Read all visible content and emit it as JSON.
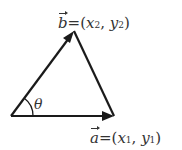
{
  "diagram": {
    "vector_b": {
      "name": "b",
      "eq": "=(",
      "x": "x",
      "xs": "2",
      "comma": ", ",
      "y": "y",
      "ys": "2",
      "close": ")"
    },
    "vector_a": {
      "name": "a",
      "eq": "=(",
      "x": "x",
      "xs": "1",
      "comma": ", ",
      "y": "y",
      "ys": "1",
      "close": ")"
    },
    "angle": "θ",
    "stroke_color": "#1a1a1a"
  }
}
